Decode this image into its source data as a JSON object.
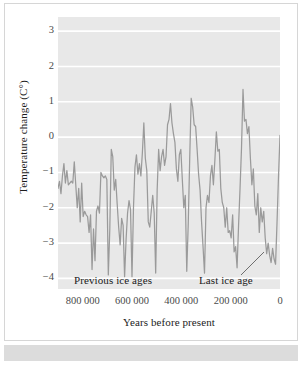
{
  "chart_data": {
    "type": "line",
    "title": "",
    "xlabel": "Years before present",
    "ylabel": "Temperature change (C°)",
    "xlim": [
      900000,
      0
    ],
    "ylim": [
      -4.3,
      3.4
    ],
    "grid": true,
    "grid_axis": "y",
    "legend": "none",
    "line_color": "#9a9a9a",
    "plot_background": "#e8e8e8",
    "gridline_color": "#ffffff",
    "x_tick_labels": [
      "800 000",
      "600 000",
      "400 000",
      "200 000",
      "0"
    ],
    "x_tick_values": [
      800000,
      600000,
      400000,
      200000,
      0
    ],
    "y_tick_labels": [
      "3",
      "2",
      "1",
      "0",
      "−1",
      "−2",
      "−3",
      "−4"
    ],
    "y_tick_values": [
      3,
      2,
      1,
      0,
      -1,
      -2,
      -3,
      -4
    ],
    "series": [
      {
        "name": "Temperature change",
        "x": [
          900000,
          894000,
          888000,
          882000,
          876000,
          870000,
          864000,
          858000,
          852000,
          846000,
          840000,
          834000,
          828000,
          822000,
          816000,
          810000,
          804000,
          798000,
          792000,
          786000,
          780000,
          774000,
          768000,
          762000,
          756000,
          750000,
          744000,
          738000,
          732000,
          726000,
          720000,
          714000,
          708000,
          702000,
          696000,
          690000,
          684000,
          678000,
          672000,
          666000,
          660000,
          654000,
          648000,
          642000,
          636000,
          630000,
          624000,
          618000,
          612000,
          606000,
          600000,
          594000,
          588000,
          582000,
          576000,
          570000,
          564000,
          558000,
          552000,
          546000,
          540000,
          534000,
          528000,
          522000,
          516000,
          510000,
          504000,
          498000,
          492000,
          486000,
          480000,
          474000,
          468000,
          462000,
          456000,
          450000,
          444000,
          438000,
          432000,
          426000,
          420000,
          414000,
          408000,
          402000,
          396000,
          390000,
          384000,
          378000,
          372000,
          366000,
          360000,
          354000,
          348000,
          342000,
          336000,
          330000,
          324000,
          318000,
          312000,
          306000,
          300000,
          294000,
          288000,
          282000,
          276000,
          270000,
          264000,
          258000,
          252000,
          246000,
          240000,
          234000,
          228000,
          222000,
          216000,
          210000,
          204000,
          198000,
          192000,
          186000,
          180000,
          174000,
          168000,
          162000,
          156000,
          150000,
          144000,
          138000,
          132000,
          126000,
          120000,
          114000,
          108000,
          102000,
          96000,
          90000,
          84000,
          78000,
          72000,
          66000,
          60000,
          54000,
          48000,
          42000,
          36000,
          30000,
          24000,
          18000,
          12000,
          6000,
          0
        ],
        "values": [
          -1.45,
          -1.25,
          -1.6,
          -1.1,
          -0.75,
          -1.3,
          -0.95,
          -1.35,
          -1.3,
          -1.25,
          -1.3,
          -0.7,
          -1.35,
          -2.0,
          -1.45,
          -2.4,
          -1.3,
          -2.25,
          -2.1,
          -2.2,
          -2.25,
          -2.7,
          -2.2,
          -3.75,
          -2.6,
          -3.5,
          -2.1,
          -1.95,
          -2.15,
          -1.0,
          -1.1,
          -1.15,
          -1.1,
          -1.2,
          -3.9,
          -2.6,
          -0.35,
          -0.55,
          -1.5,
          -1.2,
          -1.9,
          -2.55,
          -3.05,
          -2.3,
          -2.5,
          -3.95,
          -2.9,
          -2.15,
          -1.8,
          -2.05,
          -3.95,
          -2.0,
          -0.85,
          -0.5,
          -1.05,
          -0.75,
          -1.1,
          -0.45,
          0.4,
          -0.6,
          -0.95,
          -2.4,
          -2.55,
          -2.1,
          -1.65,
          -2.15,
          -3.85,
          -1.5,
          -0.35,
          -0.95,
          -0.55,
          -0.35,
          -0.8,
          -0.55,
          0.35,
          0.5,
          0.95,
          0.4,
          0.1,
          -0.15,
          -0.9,
          -1.25,
          -0.5,
          -0.35,
          -1.2,
          -2.0,
          -1.65,
          -3.8,
          -2.45,
          -0.6,
          1.1,
          0.85,
          0.35,
          0.3,
          -0.35,
          -1.05,
          -1.5,
          -2.4,
          -3.1,
          -3.85,
          -2.0,
          -1.65,
          -1.85,
          -1.1,
          -0.8,
          -1.35,
          -0.65,
          0.15,
          -0.4,
          -0.35,
          -1.45,
          -1.85,
          -2.0,
          -2.55,
          -2.0,
          -2.7,
          -2.65,
          -2.85,
          -2.2,
          -3.25,
          -3.1,
          -3.7,
          -2.5,
          -1.45,
          -0.3,
          1.35,
          0.45,
          0.5,
          0.1,
          0.3,
          -0.6,
          -1.35,
          -0.9,
          -1.95,
          -2.2,
          -1.6,
          -2.7,
          -2.0,
          -2.4,
          -2.1,
          -2.85,
          -3.3,
          -3.0,
          -3.35,
          -3.55,
          -3.15,
          -3.45,
          -3.6,
          -2.4,
          -1.1,
          0.05
        ]
      }
    ],
    "annotations": [
      {
        "text": "Previous ice ages",
        "x": 690000,
        "y": -4.25
      },
      {
        "text": "Last ice age",
        "x": 155000,
        "y": -4.25
      }
    ]
  },
  "axis": {
    "y_label": "Temperature change (C°)",
    "x_label": "Years before present"
  },
  "annotations": {
    "previous_ice_ages": "Previous ice ages",
    "last_ice_age": "Last ice age"
  }
}
